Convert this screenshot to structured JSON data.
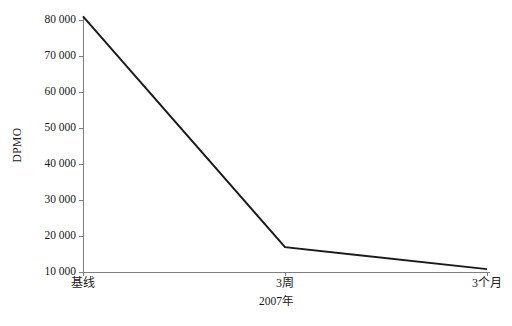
{
  "chart_data": {
    "type": "line",
    "title": "",
    "subtitle": "",
    "xlabel": "2007年",
    "ylabel": "DPMO",
    "categories": [
      "基线",
      "3周",
      "3个月"
    ],
    "x_tick_labels": [
      "基线",
      "3周",
      "3个月"
    ],
    "y_tick_labels": [
      "10 000",
      "20 000",
      "30 000",
      "40 000",
      "50 000",
      "60 000",
      "70 000",
      "80 000"
    ],
    "y_tick_values": [
      10000,
      20000,
      30000,
      40000,
      50000,
      60000,
      70000,
      80000
    ],
    "ylim": [
      10000,
      81500
    ],
    "xlim": [
      0,
      2
    ],
    "grid": false,
    "legend": false,
    "legend_position": "none",
    "series": [
      {
        "name": "DPMO",
        "values": [
          81000,
          16900,
          10800
        ],
        "color": "#1a1a1a",
        "line_width": 2,
        "markers": false
      }
    ],
    "annotations": []
  },
  "axes": {
    "y_axis_title": "DPMO",
    "x_axis_title": "2007年",
    "axis_color": "#808080",
    "tick_color": "#808080",
    "text_color": "#1a1a1a"
  },
  "caption": {
    "text": ""
  },
  "colors": {
    "background": "#ffffff",
    "line": "#1a1a1a",
    "axis": "#808080"
  }
}
